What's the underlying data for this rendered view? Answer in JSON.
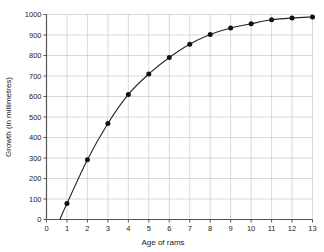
{
  "chart_data": {
    "type": "line",
    "title": "",
    "xlabel": "Age of rams",
    "ylabel": "Growth (in millimetres)",
    "xlim": [
      0,
      13
    ],
    "ylim": [
      0,
      1000
    ],
    "xticks": [
      0,
      1,
      2,
      3,
      4,
      5,
      6,
      7,
      8,
      9,
      10,
      11,
      12,
      13
    ],
    "yticks": [
      0,
      100,
      200,
      300,
      400,
      500,
      600,
      700,
      800,
      900,
      1000
    ],
    "grid": true,
    "legend": false,
    "markers": "filled-circle",
    "series": [
      {
        "name": "Growth",
        "x": [
          1,
          2,
          3,
          4,
          5,
          6,
          7,
          8,
          9,
          10,
          11,
          12,
          13
        ],
        "values": [
          78,
          292,
          468,
          610,
          710,
          790,
          855,
          902,
          934,
          955,
          974,
          983,
          988
        ]
      }
    ],
    "curve_start": {
      "x": 0.65,
      "y": 0
    },
    "colors": {
      "line": "#262626",
      "marker": "#111111",
      "grid": "#c8c8c8",
      "axis": "#555555",
      "text": "#1a1a1a",
      "background": "#ffffff"
    }
  },
  "axes": {
    "x_title": "Age of rams",
    "y_title": "Growth (in millimetres)",
    "x_tick_labels": [
      "0",
      "1",
      "2",
      "3",
      "4",
      "5",
      "6",
      "7",
      "8",
      "9",
      "10",
      "11",
      "12",
      "13"
    ],
    "y_tick_labels": [
      "0",
      "100",
      "200",
      "300",
      "400",
      "500",
      "600",
      "700",
      "800",
      "900",
      "1000"
    ]
  }
}
